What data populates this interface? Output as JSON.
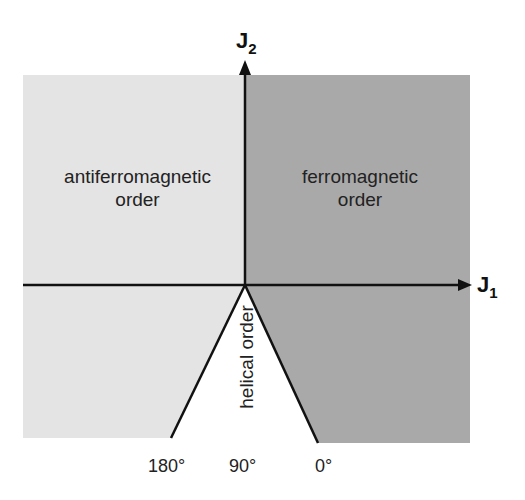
{
  "diagram": {
    "type": "phase diagram",
    "axes": {
      "x": {
        "label": "J",
        "subscript": "1"
      },
      "y": {
        "label": "J",
        "subscript": "2"
      }
    },
    "regions": [
      {
        "name": "antiferromagnetic",
        "line1": "antiferromagnetic",
        "line2": "order",
        "color": "#e4e4e4"
      },
      {
        "name": "ferromagnetic",
        "line1": "ferromagnetic",
        "line2": "order",
        "color": "#a9a9a9"
      },
      {
        "name": "helical",
        "label": "helical order",
        "color": "#ffffff"
      }
    ],
    "angles": [
      "180°",
      "90°",
      "0°"
    ]
  }
}
